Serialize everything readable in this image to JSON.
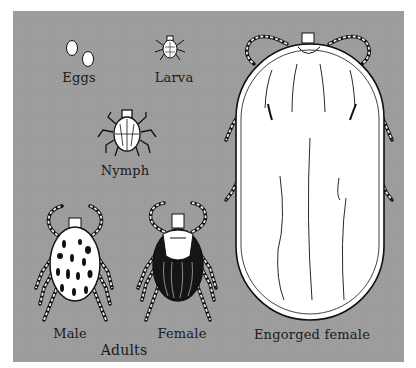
{
  "figure": {
    "colors": {
      "background": "#ffffff",
      "panel": "#9c9c9c",
      "ink": "#1a1a1a",
      "body_light": "#ffffff",
      "body_dark": "#151515"
    },
    "stages": [
      {
        "id": "eggs",
        "label": "Eggs"
      },
      {
        "id": "larva",
        "label": "Larva"
      },
      {
        "id": "nymph",
        "label": "Nymph"
      },
      {
        "id": "male",
        "label": "Male"
      },
      {
        "id": "female",
        "label": "Female"
      },
      {
        "id": "engorged",
        "label": "Engorged female"
      }
    ],
    "group_label": "Adults"
  }
}
